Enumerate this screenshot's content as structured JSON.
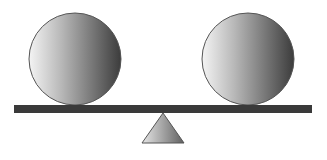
{
  "diagram": {
    "type": "balance-scale",
    "colors": {
      "background": "#ffffff",
      "beam": "#3a3a3a",
      "ball_light": "#f4f4f4",
      "ball_dark": "#3c3c3c",
      "fulcrum_light": "#e0e0e0",
      "fulcrum_dark": "#6a6a6a",
      "outline": "#555555"
    },
    "left_ball": {
      "cx": 75,
      "cy": 59,
      "r": 46
    },
    "right_ball": {
      "cx": 248,
      "cy": 59,
      "r": 46
    },
    "beam": {
      "x": 14,
      "y": 105,
      "width": 298,
      "height": 8
    },
    "fulcrum": {
      "apex_x": 163,
      "apex_y": 113,
      "base_left": 142,
      "base_right": 184,
      "base_y": 143
    }
  }
}
